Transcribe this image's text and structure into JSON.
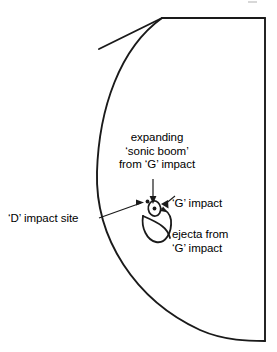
{
  "figure": {
    "name": "planetary-limb-impact-diagram",
    "background_color": "#ffffff",
    "stroke_color": "#1a1a1a",
    "annotations": {
      "sonic_boom": {
        "line1": "expanding",
        "line2": "‘sonic boom’",
        "line3": "from ‘G’ impact"
      },
      "g_impact": {
        "text": "‘G’ impact"
      },
      "d_impact": {
        "text": "‘D’ impact site"
      },
      "ejecta": {
        "line1": "ejecta from",
        "line2": "‘G’ impact"
      }
    },
    "shapes": {
      "planet_limb": "arc",
      "sonic_boom_ring": "ellipse",
      "impact_point": "dot",
      "ejecta_plume": "curve",
      "d_impact_marker": "dot"
    }
  }
}
